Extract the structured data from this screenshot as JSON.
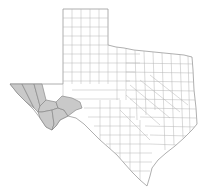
{
  "map": {
    "subject": "Texas counties",
    "colors": {
      "background": "#ffffff",
      "county_fill": "#ffffff",
      "county_border": "#b4b4b4",
      "state_border": "#9a9a9a",
      "highlight_fill": "#c9c9c9",
      "highlight_border": "#8a8a8a"
    },
    "highlighted_region": "Far West Texas (Trans-Pecos) counties",
    "highlighted_counties": [
      "El Paso",
      "Hudspeth",
      "Culberson",
      "Jeff Davis",
      "Presidio",
      "Brewster",
      "Pecos"
    ]
  }
}
